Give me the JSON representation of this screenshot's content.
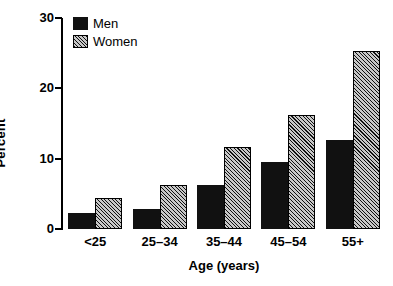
{
  "chart_data": {
    "type": "bar",
    "title": "",
    "xlabel": "Age (years)",
    "ylabel": "Percent",
    "categories": [
      "<25",
      "25–34",
      "35–44",
      "45–54",
      "55+"
    ],
    "series": [
      {
        "name": "Men",
        "values": [
          2.3,
          2.9,
          6.3,
          9.5,
          12.7
        ]
      },
      {
        "name": "Women",
        "values": [
          4.4,
          6.2,
          11.7,
          16.2,
          25.3
        ]
      }
    ],
    "ylim": [
      0,
      30
    ],
    "yticks": [
      0,
      10,
      20,
      30
    ],
    "ytick_labels": [
      "0",
      "10",
      "20",
      "30"
    ],
    "grid": false,
    "legend_position": "top-left-inside",
    "legend_entries": [
      "Men",
      "Women"
    ],
    "colors": {
      "men": "#111111",
      "women_fill": "#c8c8c8",
      "women_hatch": "#000000",
      "axis": "#000000",
      "background": "#ffffff"
    }
  }
}
